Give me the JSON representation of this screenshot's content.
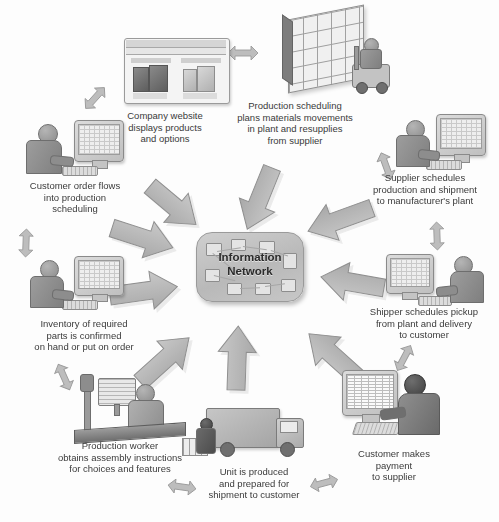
{
  "diagram": {
    "hub": {
      "line1": "Information",
      "line2": "Network"
    },
    "palette": {
      "background": "#fdfdfd",
      "arrow_fill": "#b5b5b5",
      "arrow_stroke": "#8f8f8f",
      "arrow_shadow": "#d8d8d8",
      "hub_fill": "#c4c4c4",
      "text": "#3a3a3a"
    },
    "nodes": [
      {
        "id": "company-website",
        "label": "Company website\ndisplays products\nand options",
        "illustration": "website-screenshot-with-products"
      },
      {
        "id": "production-scheduling",
        "label": "Production scheduling\nplans materials movements\nin plant and resupplies\nfrom supplier",
        "illustration": "warehouse-rack-with-forklift"
      },
      {
        "id": "supplier-schedules",
        "label": "Supplier schedules\nproduction and shipment\nto manufacturer's plant",
        "illustration": "person-at-computer"
      },
      {
        "id": "shipper-schedules",
        "label": "Shipper schedules pickup\nfrom plant and delivery\nto customer",
        "illustration": "person-at-computer"
      },
      {
        "id": "customer-payment",
        "label": "Customer makes\npayment\nto supplier",
        "illustration": "person-at-computer-spreadsheet"
      },
      {
        "id": "unit-produced",
        "label": "Unit is produced\nand prepared for\nshipment to customer",
        "illustration": "delivery-truck-loading"
      },
      {
        "id": "production-worker",
        "label": "Production worker\nobtains assembly instructions\nfor choices and features",
        "illustration": "worker-at-assembly-line-terminal"
      },
      {
        "id": "inventory-confirmed",
        "label": "Inventory of required\nparts is confirmed\non hand or put on order",
        "illustration": "person-at-computer"
      },
      {
        "id": "customer-order",
        "label": "Customer order flows\ninto production\nscheduling",
        "illustration": "person-at-computer"
      }
    ]
  }
}
